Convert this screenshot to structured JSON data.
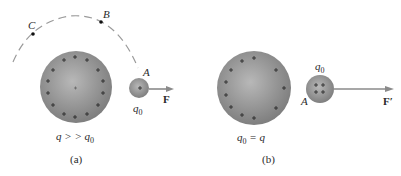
{
  "panel_a": {
    "caption": "(a)",
    "points": {
      "A": "A",
      "B": "B",
      "C": "C"
    },
    "large_charge_label": "q > > q",
    "large_charge_sub": "0",
    "test_charge_label": "q",
    "test_charge_sub": "0",
    "force_label": "F"
  },
  "panel_b": {
    "caption": "(b)",
    "point_A": "A",
    "large_charge_label_pre": "q",
    "large_charge_label_sub": "0",
    "large_charge_label_post": "= q",
    "test_charge_label": "q",
    "test_charge_sub": "0",
    "force_label": "F′"
  },
  "colors": {
    "sphere": "#8e8e8e",
    "sphere_highlight": "#b8b8b8",
    "arrow": "#8a8a8a",
    "dashed_path": "#9a9a9a",
    "text": "#2a2a2a"
  }
}
